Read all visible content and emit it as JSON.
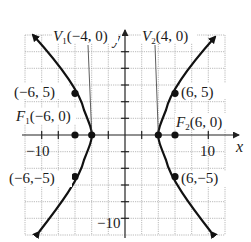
{
  "diagram": {
    "type": "hyperbola-graph",
    "equation_implied": "x^2/16 - y^2/20 = 1",
    "axes": {
      "x_label": "x",
      "y_label": "y",
      "x_tick_label": "10",
      "y_tick_label": "−10",
      "x_neg_tick_label": "−10"
    },
    "grid": {
      "x_range": [
        -12,
        12
      ],
      "y_range": [
        -12,
        12
      ],
      "step": 2
    },
    "labels": {
      "v1": {
        "prefix": "V",
        "sub": "1",
        "text": "(−4, 0)"
      },
      "v2": {
        "prefix": "V",
        "sub": "2",
        "text": "(4, 0)"
      },
      "f1": {
        "prefix": "F",
        "sub": "1",
        "text": "(−6, 0)"
      },
      "f2": {
        "prefix": "F",
        "sub": "2",
        "text": "(6, 0)"
      },
      "p1": "(−6, 5)",
      "p2": "(6, 5)",
      "p3": "(−6,−5)",
      "p4": "(6,−5)"
    },
    "points": [
      {
        "name": "V1",
        "x": -4,
        "y": 0
      },
      {
        "name": "V2",
        "x": 4,
        "y": 0
      },
      {
        "name": "F1",
        "x": -6,
        "y": 0
      },
      {
        "name": "F2",
        "x": 6,
        "y": 0
      },
      {
        "name": "P1",
        "x": -6,
        "y": 5
      },
      {
        "name": "P2",
        "x": 6,
        "y": 5
      },
      {
        "name": "P3",
        "x": -6,
        "y": -5
      },
      {
        "name": "P4",
        "x": 6,
        "y": -5
      }
    ],
    "colors": {
      "curve": "#111111",
      "grid": "#9a9a9a",
      "axis": "#222222"
    }
  }
}
